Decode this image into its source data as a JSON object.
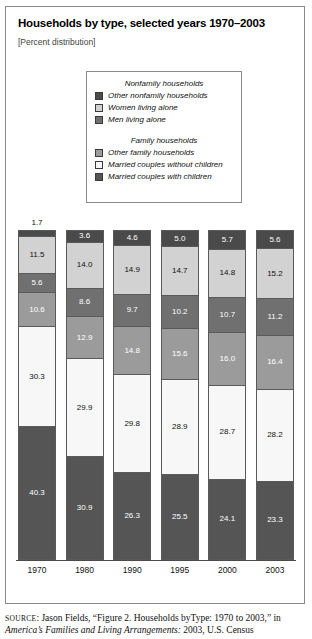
{
  "figure": {
    "title": "Households by type, selected years 1970–2003",
    "subtitle": "[Percent distribution]"
  },
  "legend": {
    "groups": [
      {
        "heading": "Nonfamily households",
        "items": [
          {
            "label": "Other nonfamily households",
            "color": "#4a4a4a"
          },
          {
            "label": "Women living alone",
            "color": "#d2d2d2"
          },
          {
            "label": "Men living alone",
            "color": "#707070"
          }
        ]
      },
      {
        "heading": "Family households",
        "items": [
          {
            "label": "Other family households",
            "color": "#9b9b9b"
          },
          {
            "label": "Married couples without children",
            "color": "#f7f7f7"
          },
          {
            "label": "Married couples with children",
            "color": "#555555"
          }
        ]
      }
    ]
  },
  "source": {
    "prefix": "SOURCE",
    "line1": ": Jason Fields, “Figure 2. Households byType: 1970 to 2003,” in",
    "line2_italic": "America’s Families and Living Arrangements:",
    "line2_rest": " 2003, U.S. Census"
  },
  "chart_data": {
    "type": "bar",
    "subtype": "stacked-100-percent",
    "title": "Households by type, selected years 1970–2003",
    "subtitle": "[Percent distribution]",
    "xlabel": "",
    "ylabel": "Percent distribution",
    "ylim": [
      0,
      100
    ],
    "grid": false,
    "legend_position": "top-center",
    "categories": [
      "1970",
      "1980",
      "1990",
      "1995",
      "2000",
      "2003"
    ],
    "stack_order_top_to_bottom": [
      "Other nonfamily households",
      "Women living alone",
      "Men living alone",
      "Other family households",
      "Married couples without children",
      "Married couples with children"
    ],
    "series": [
      {
        "name": "Other nonfamily households",
        "color": "#4a4a4a",
        "text_color": "#ffffff",
        "values": [
          1.7,
          3.6,
          4.6,
          5.0,
          5.7,
          5.6
        ],
        "labels": [
          "1.7",
          "3.6",
          "4.6",
          "5.0",
          "5.7",
          "5.6"
        ],
        "label_outside": [
          true,
          false,
          false,
          false,
          false,
          false
        ]
      },
      {
        "name": "Women living alone",
        "color": "#d2d2d2",
        "text_color": "#111111",
        "values": [
          11.5,
          14.0,
          14.9,
          14.7,
          14.8,
          15.2
        ],
        "labels": [
          "11.5",
          "14.0",
          "14.9",
          "14.7",
          "14.8",
          "15.2"
        ],
        "label_outside": [
          false,
          false,
          false,
          false,
          false,
          false
        ]
      },
      {
        "name": "Men living alone",
        "color": "#707070",
        "text_color": "#ffffff",
        "values": [
          5.6,
          8.6,
          9.7,
          10.2,
          10.7,
          11.2
        ],
        "labels": [
          "5.6",
          "8.6",
          "9.7",
          "10.2",
          "10.7",
          "11.2"
        ],
        "label_outside": [
          false,
          false,
          false,
          false,
          false,
          false
        ]
      },
      {
        "name": "Other family households",
        "color": "#9b9b9b",
        "text_color": "#ffffff",
        "values": [
          10.6,
          12.9,
          14.8,
          15.6,
          16.0,
          16.4
        ],
        "labels": [
          "10.6",
          "12.9",
          "14.8",
          "15.6",
          "16.0",
          "16.4"
        ],
        "label_outside": [
          false,
          false,
          false,
          false,
          false,
          false
        ]
      },
      {
        "name": "Married couples without children",
        "color": "#f7f7f7",
        "text_color": "#111111",
        "values": [
          30.3,
          29.9,
          29.8,
          28.9,
          28.7,
          28.2
        ],
        "labels": [
          "30.3",
          "29.9",
          "29.8",
          "28.9",
          "28.7",
          "28.2"
        ],
        "label_outside": [
          false,
          false,
          false,
          false,
          false,
          false
        ]
      },
      {
        "name": "Married couples with children",
        "color": "#555555",
        "text_color": "#ffffff",
        "values": [
          40.3,
          30.9,
          26.3,
          25.5,
          24.1,
          23.3
        ],
        "labels": [
          "40.3",
          "30.9",
          "26.3",
          "25.5",
          "24.1",
          "23.3"
        ],
        "label_outside": [
          false,
          false,
          false,
          false,
          false,
          false
        ]
      }
    ]
  }
}
